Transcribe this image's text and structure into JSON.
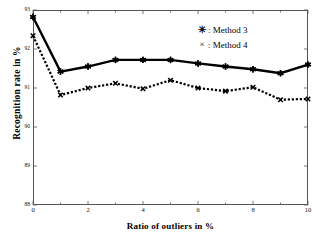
{
  "chart_data": {
    "type": "line",
    "title": "",
    "subtitle": "",
    "xlabel": "Ratio of outliers in %",
    "ylabel": "Recognition rate in %",
    "x": [
      0,
      1,
      2,
      3,
      4,
      5,
      6,
      7,
      8,
      9,
      10
    ],
    "xlim": [
      0,
      10
    ],
    "ylim": [
      88,
      93
    ],
    "xticks": [
      0,
      2,
      4,
      6,
      8,
      10
    ],
    "xtick_labels": [
      "0",
      "2",
      "4",
      "6",
      "8",
      "10"
    ],
    "xminorticks": [
      1,
      3,
      5,
      7,
      9
    ],
    "yticks": [
      88,
      89,
      90,
      91,
      92,
      93
    ],
    "ytick_labels": [
      "88",
      "89",
      "90",
      "91",
      "92",
      "93"
    ],
    "grid": false,
    "legend_position": "top-right",
    "series": [
      {
        "name": "Method 3",
        "legend_label": ": Method 3",
        "marker": "asterisk",
        "marker_glyph": "✳",
        "linestyle": "solid",
        "color": "#000000",
        "values": [
          92.82,
          91.42,
          91.55,
          91.72,
          91.72,
          91.72,
          91.63,
          91.55,
          91.48,
          91.38,
          91.6
        ]
      },
      {
        "name": "Method 4",
        "legend_label": ": Method 4",
        "marker": "cross",
        "marker_glyph": "×",
        "linestyle": "dotted",
        "color": "#000000",
        "values": [
          92.34,
          90.82,
          91.0,
          91.12,
          90.98,
          91.2,
          91.0,
          90.92,
          91.02,
          90.7,
          90.72
        ]
      }
    ]
  }
}
